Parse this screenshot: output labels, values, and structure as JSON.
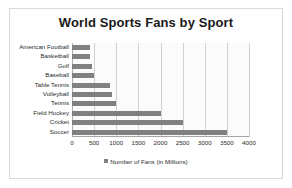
{
  "chart_data": {
    "type": "bar",
    "orientation": "horizontal",
    "title": "World Sports Fans by Sport",
    "categories": [
      "American Football",
      "Basketball",
      "Golf",
      "Baseball",
      "Table Tennis",
      "Volleyball",
      "Tennis",
      "Field Hockey",
      "Cricket",
      "Soccer"
    ],
    "values": [
      400,
      400,
      450,
      500,
      850,
      900,
      1000,
      2000,
      2500,
      3500
    ],
    "series": [
      {
        "name": "Number of Fans (in Millions)",
        "values": [
          400,
          400,
          450,
          500,
          850,
          900,
          1000,
          2000,
          2500,
          3500
        ]
      }
    ],
    "xlabel": "",
    "ylabel": "",
    "xlim": [
      0,
      4000
    ],
    "xticks": [
      0,
      500,
      1000,
      1500,
      2000,
      2500,
      3000,
      3500,
      4000
    ],
    "xtick_labels": [
      "0",
      "500",
      "1000",
      "1500",
      "2000",
      "2500",
      "3000",
      "3500",
      "4000"
    ],
    "grid": "vertical",
    "legend": {
      "position": "bottom",
      "entries": [
        {
          "label": "Number of Fans (in Millions)",
          "color": "#808080",
          "marker": "legend-square-marker"
        }
      ]
    },
    "colors": {
      "bar": "#808080",
      "gridline": "#d0d0d0",
      "axis": "#a6a6a6",
      "plot_background": "#fbfbfb",
      "frame_border": "#d9d9d9",
      "text": "#2b2b2b",
      "title": "#1a1a1a"
    }
  }
}
